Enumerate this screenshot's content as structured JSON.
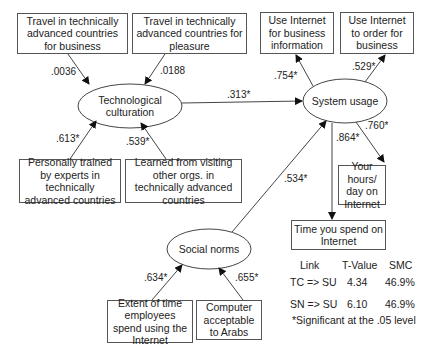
{
  "diagram": {
    "latent_constructs": [
      {
        "id": "TC",
        "label": "Technological culturation"
      },
      {
        "id": "SU",
        "label": "System usage"
      },
      {
        "id": "SN",
        "label": "Social norms"
      }
    ],
    "indicators": {
      "tc_business_travel": "Travel in technically advanced countries for business",
      "tc_pleasure_travel": "Travel in technically advanced countries for pleasure",
      "tc_trained": "Personally trained by experts in technically advanced countries",
      "tc_learned": "Learned from visiting other orgs. in technically advanced countries",
      "su_business_info": "Use Internet for business information",
      "su_order": "Use Internet to order for business",
      "su_hours": "Your hours/ day on Internet",
      "su_time": "Time you spend on Internet",
      "sn_extent": "Extent of time employees spend using the Internet",
      "sn_acceptable": "Computer acceptable to Arabs"
    },
    "coefficients": {
      "tc_business_travel": ".0036",
      "tc_pleasure_travel": ".0188",
      "tc_trained": ".613*",
      "tc_learned": ".539*",
      "tc_to_su": ".313*",
      "sn_to_su": ".534*",
      "su_business_info": ".754*",
      "su_order": ".529*",
      "su_hours": ".760*",
      "su_time": ".864*",
      "sn_extent": ".634*",
      "sn_acceptable": ".655*"
    },
    "table": {
      "headers": [
        "Link",
        "T-Value",
        "SMC"
      ],
      "rows": [
        [
          "TC => SU",
          "4.34",
          "46.9%"
        ],
        [
          "SN => SU",
          "6.10",
          "46.9%"
        ]
      ],
      "footnote": "*Significant at the .05 level"
    }
  }
}
